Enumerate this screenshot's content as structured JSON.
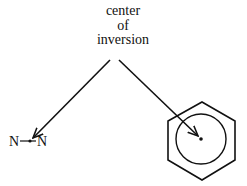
{
  "label": {
    "lines": [
      "center",
      "of",
      "inversion"
    ]
  },
  "left_molecule": {
    "atom1": "N",
    "atom2": "N",
    "description": "N–N bond with center point"
  },
  "right_molecule": {
    "description": "benzene ring with inscribed circle and center point"
  },
  "colors": {
    "stroke": "#111111",
    "background": "#ffffff"
  }
}
